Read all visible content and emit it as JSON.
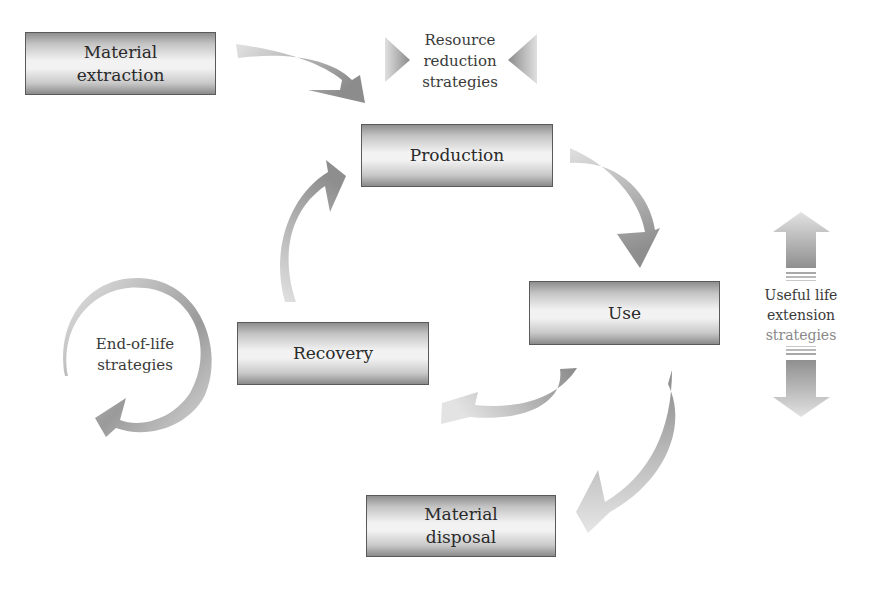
{
  "diagram": {
    "type": "lifecycle-flow",
    "boxes": {
      "material_extraction": {
        "line1": "Material",
        "line2": "extraction"
      },
      "production": {
        "label": "Production"
      },
      "use": {
        "label": "Use"
      },
      "recovery": {
        "label": "Recovery"
      },
      "material_disposal": {
        "line1": "Material",
        "line2": "disposal"
      }
    },
    "strategies": {
      "resource_reduction": {
        "line1": "Resource",
        "line2": "reduction",
        "line3": "strategies"
      },
      "useful_life_extension": {
        "line1": "Useful life",
        "line2": "extension",
        "line3": "strategies"
      },
      "end_of_life": {
        "line1": "End-of-life",
        "line2": "strategies"
      }
    },
    "flows": [
      {
        "from": "Material extraction",
        "to": "Production"
      },
      {
        "from": "Production",
        "to": "Use"
      },
      {
        "from": "Use",
        "to": "Recovery"
      },
      {
        "from": "Use",
        "to": "Material disposal"
      },
      {
        "from": "Recovery",
        "to": "Production"
      }
    ],
    "colors": {
      "arrow_dark": "#8f8f8f",
      "arrow_light": "#dcdcdc",
      "box_border": "#5a5a5a"
    }
  }
}
